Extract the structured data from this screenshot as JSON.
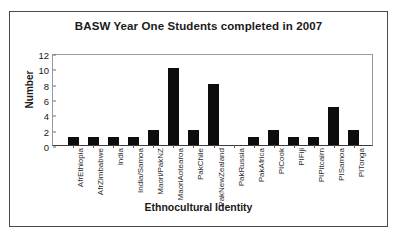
{
  "figure": {
    "title": "BASW Year One Students completed in 2007"
  },
  "chart_data": {
    "type": "bar",
    "title": "BASW Year One Students completed in 2007",
    "xlabel": "Ethnocultural Identity",
    "ylabel": "Number",
    "categories": [
      "AfrEthiopia",
      "AfrZimbabwe",
      "India",
      "India/Samoa",
      "Maori/PakNZ",
      "MaoriAotearoa",
      "PakChile",
      "PakNewZealand",
      "PakRussia",
      "PakAfrica",
      "PICook",
      "PIFiji",
      "PIPitcairn",
      "PISamoa",
      "PITonga"
    ],
    "values": [
      1,
      1,
      1,
      1,
      2,
      10,
      2,
      8,
      0,
      1,
      2,
      1,
      1,
      5,
      2
    ],
    "ylim": [
      0,
      12
    ],
    "yticks": [
      0,
      2,
      4,
      6,
      8,
      10,
      12
    ],
    "ytick_labels": [
      "0",
      "2",
      "4",
      "6",
      "8",
      "10",
      "12"
    ],
    "grid": false,
    "legend": false,
    "bar_color": "#0d0d0d"
  }
}
